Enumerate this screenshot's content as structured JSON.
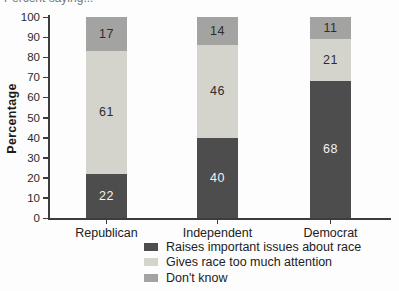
{
  "figure": {
    "clipped_caption": "Percent saying..."
  },
  "chart_data": {
    "type": "bar",
    "stacked": true,
    "title_partial_visible": "Percent saying... (clipped at top edge of screenshot)",
    "categories": [
      "Republican",
      "Independent",
      "Democrat"
    ],
    "series": [
      {
        "name": "Raises important issues about race",
        "color": "#4d4d4d",
        "label_color": "#f4f4f2",
        "values": [
          22,
          40,
          68
        ]
      },
      {
        "name": "Gives race too much attention",
        "color": "#d4d4cd",
        "label_color": "#2d2d2d",
        "values": [
          61,
          46,
          21
        ]
      },
      {
        "name": "Don't know",
        "color": "#a3a3a1",
        "label_color": "#2d2d2d",
        "values": [
          17,
          14,
          11
        ]
      }
    ],
    "xlabel": "",
    "ylabel": "Percentage",
    "ylim": [
      0,
      100
    ],
    "yticks": [
      0,
      10,
      20,
      30,
      40,
      50,
      60,
      70,
      80,
      90,
      100
    ],
    "grid": false,
    "legend_position": "bottom"
  }
}
